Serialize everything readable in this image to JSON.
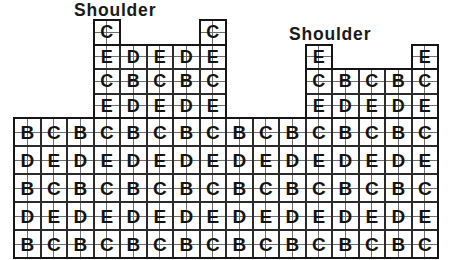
{
  "labels": {
    "left_shoulder_label": "Shoulder",
    "right_shoulder_label": "Shoulder"
  },
  "palette": {
    "background": "#ffffff",
    "block_border": "#2b2b2b",
    "fine_line": "#6e6e6e",
    "letter_color": "#131313",
    "outline_color": "#161616",
    "label_color": "#1a1a1a"
  },
  "layout": {
    "canvas_w": 450,
    "canvas_h": 260,
    "origin_x": 14,
    "block_w": 26.5,
    "body_top": 118,
    "body_block_h": 28,
    "shoulder_block_h": 24.5
  },
  "sections": {
    "left_shoulder": {
      "name": "left-shoulder",
      "col_offset": 3,
      "top": 20,
      "block_h": 24.5,
      "letter_size": 18,
      "rows": [
        [
          "C",
          null,
          null,
          null,
          "C"
        ],
        [
          "E",
          "D",
          "E",
          "D",
          "E"
        ],
        [
          "C",
          "B",
          "C",
          "B",
          "C"
        ],
        [
          "E",
          "D",
          "E",
          "D",
          "E"
        ]
      ]
    },
    "right_shoulder": {
      "name": "right-shoulder",
      "col_offset": 11,
      "top": 44.5,
      "block_h": 24.5,
      "letter_size": 18,
      "rows": [
        [
          "E",
          null,
          null,
          null,
          "E"
        ],
        [
          "C",
          "B",
          "C",
          "B",
          "C"
        ],
        [
          "E",
          "D",
          "E",
          "D",
          "E"
        ]
      ]
    },
    "body": {
      "name": "body",
      "col_offset": 0,
      "top": 118,
      "block_h": 28,
      "letter_size": 19,
      "rows": [
        [
          "B",
          "C",
          "B",
          "C",
          "B",
          "C",
          "B",
          "C",
          "B",
          "C",
          "B",
          "C",
          "B",
          "C",
          "B",
          "C"
        ],
        [
          "D",
          "E",
          "D",
          "E",
          "D",
          "E",
          "D",
          "E",
          "D",
          "E",
          "D",
          "E",
          "D",
          "E",
          "D",
          "E"
        ],
        [
          "B",
          "C",
          "B",
          "C",
          "B",
          "C",
          "B",
          "C",
          "B",
          "C",
          "B",
          "C",
          "B",
          "C",
          "B",
          "C"
        ],
        [
          "D",
          "E",
          "D",
          "E",
          "D",
          "E",
          "D",
          "E",
          "D",
          "E",
          "D",
          "E",
          "D",
          "E",
          "D",
          "E"
        ],
        [
          "B",
          "C",
          "B",
          "C",
          "B",
          "C",
          "B",
          "C",
          "B",
          "C",
          "B",
          "C",
          "B",
          "C",
          "B",
          "C"
        ]
      ]
    }
  },
  "outlines": [
    {
      "name": "body-outline",
      "x": 14,
      "y": 118,
      "w": 424,
      "h": 140
    },
    {
      "name": "left-shoulder-outline",
      "x": 93.5,
      "y": 44.5,
      "w": 132.5,
      "h": 73.5
    },
    {
      "name": "left-shoulder-cap-left",
      "x": 93.5,
      "y": 20,
      "w": 26.5,
      "h": 24.5
    },
    {
      "name": "left-shoulder-cap-right",
      "x": 199.5,
      "y": 20,
      "w": 26.5,
      "h": 24.5
    },
    {
      "name": "right-shoulder-outline",
      "x": 305.5,
      "y": 69,
      "w": 132.5,
      "h": 49
    },
    {
      "name": "right-shoulder-cap-left",
      "x": 305.5,
      "y": 44.5,
      "w": 26.5,
      "h": 24.5
    },
    {
      "name": "right-shoulder-cap-right",
      "x": 411.5,
      "y": 44.5,
      "w": 26.5,
      "h": 24.5
    }
  ]
}
